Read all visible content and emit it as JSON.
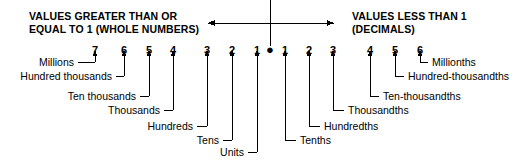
{
  "diagram": {
    "title_left": [
      "VALUES GREATER THAN OR",
      "EQUAL TO 1 (WHOLE NUMBERS)"
    ],
    "title_right": [
      "VALUES LESS THAN 1",
      "(DECIMALS)"
    ],
    "decimal_point_glyph": "●",
    "colors": {
      "ink": "#000000",
      "paper": "#ffffff"
    },
    "whole_digits": [
      {
        "label": "7",
        "x": 95,
        "place": "Millions"
      },
      {
        "label": "6",
        "x": 124,
        "place": "Hundred thousands"
      },
      {
        "label": "5",
        "x": 149,
        "place": "Ten thousands"
      },
      {
        "label": "4",
        "x": 173,
        "place": "Thousands"
      },
      {
        "label": "3",
        "x": 207,
        "place": "Hundreds"
      },
      {
        "label": "2",
        "x": 232,
        "place": "Tens"
      },
      {
        "label": "1",
        "x": 257,
        "place": "Units"
      }
    ],
    "decimal_digits": [
      {
        "label": "1",
        "x": 285,
        "place": "Tenths"
      },
      {
        "label": "2",
        "x": 309,
        "place": "Hundredths"
      },
      {
        "label": "3",
        "x": 333,
        "place": "Thousandths"
      },
      {
        "label": "4",
        "x": 370,
        "place": "Ten-thousandths"
      },
      {
        "label": "5",
        "x": 395,
        "place": "Hundred-thousandths"
      },
      {
        "label": "6",
        "x": 420,
        "place": "Millionths"
      }
    ],
    "left_labels": [
      {
        "text": "Millions",
        "end_x": 74,
        "y": 62,
        "target_x": 95,
        "leader_from": 78
      },
      {
        "text": "Hundred thousands",
        "end_x": 112,
        "y": 76,
        "target_x": 124,
        "leader_from": 116
      },
      {
        "text": "Ten thousands",
        "end_x": 136,
        "y": 96,
        "target_x": 149,
        "leader_from": 140
      },
      {
        "text": "Thousands",
        "end_x": 160,
        "y": 110,
        "target_x": 173,
        "leader_from": 164
      },
      {
        "text": "Hundreds",
        "end_x": 193,
        "y": 126,
        "target_x": 207,
        "leader_from": 197
      },
      {
        "text": "Tens",
        "end_x": 219,
        "y": 140,
        "target_x": 232,
        "leader_from": 223
      },
      {
        "text": "Units",
        "end_x": 244,
        "y": 152,
        "target_x": 257,
        "leader_from": 248
      }
    ],
    "right_labels": [
      {
        "text": "Millionths",
        "start_x": 432,
        "y": 62,
        "target_x": 420,
        "leader_to": 428
      },
      {
        "text": "Hundred-thousandths",
        "start_x": 408,
        "y": 76,
        "target_x": 395,
        "leader_to": 404
      },
      {
        "text": "Ten-thousandths",
        "start_x": 383,
        "y": 96,
        "target_x": 370,
        "leader_to": 379
      },
      {
        "text": "Thousandths",
        "start_x": 348,
        "y": 110,
        "target_x": 333,
        "leader_to": 344
      },
      {
        "text": "Hundredths",
        "start_x": 324,
        "y": 126,
        "target_x": 309,
        "leader_to": 320
      },
      {
        "text": "Tenths",
        "start_x": 300,
        "y": 140,
        "target_x": 285,
        "leader_to": 296
      }
    ],
    "decimal_point": {
      "x": 270,
      "y": 55
    },
    "axis": {
      "y": 23,
      "x_left": 208,
      "x_right": 334,
      "divider_x": 270,
      "divider_y_top": 0,
      "divider_y_bottom": 46
    },
    "arrow_top_y": 50,
    "arrow_head_size": 3
  }
}
